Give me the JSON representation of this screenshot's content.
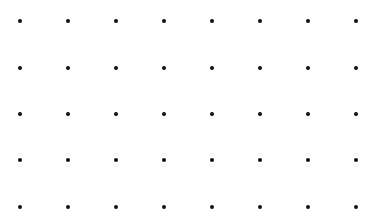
{
  "diagram": {
    "type": "dot-grid",
    "background_color": "#ffffff",
    "dot_color": "#111111",
    "dot_diameter": 4,
    "columns": 8,
    "rows": 5,
    "column_x": [
      20,
      68,
      116,
      164,
      212,
      260,
      308,
      356
    ],
    "row_y": [
      21,
      68,
      114,
      160,
      207
    ]
  }
}
